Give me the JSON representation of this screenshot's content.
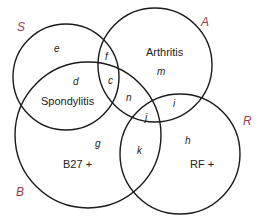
{
  "diagram": {
    "type": "venn",
    "sets": [
      {
        "id": "S",
        "label": "S",
        "name": "Spondylitis"
      },
      {
        "id": "A",
        "label": "A",
        "name": "Arthritis"
      },
      {
        "id": "B",
        "label": "B",
        "name": "B27 +"
      },
      {
        "id": "R",
        "label": "R",
        "name": "RF +"
      }
    ],
    "regions": [
      "e",
      "f",
      "d",
      "c",
      "m",
      "n",
      "i",
      "j",
      "g",
      "k",
      "h"
    ],
    "colors": {
      "set_label": "#9b3a4a",
      "stroke": "#1a1a1a",
      "text": "#222222"
    }
  }
}
